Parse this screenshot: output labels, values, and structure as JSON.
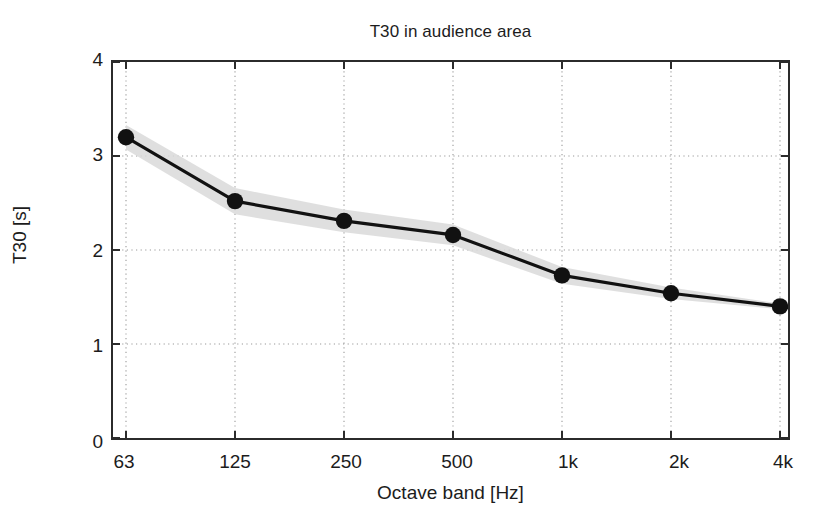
{
  "chart_data": {
    "type": "line",
    "title": "T30 in audience area",
    "xlabel": "Octave band [Hz]",
    "ylabel": "T30 [s]",
    "categories": [
      "63",
      "125",
      "250",
      "500",
      "1k",
      "2k",
      "4k"
    ],
    "values": [
      3.2,
      2.52,
      2.31,
      2.16,
      1.73,
      1.54,
      1.4
    ],
    "band_upper": [
      3.33,
      2.66,
      2.43,
      2.27,
      1.82,
      1.6,
      1.43
    ],
    "band_lower": [
      3.07,
      2.38,
      2.19,
      2.05,
      1.64,
      1.48,
      1.37
    ],
    "band_label": "standard deviation band",
    "series_name": "T30",
    "ylim": [
      0,
      4
    ],
    "yticks": [
      "0",
      "1",
      "2",
      "3",
      "4"
    ],
    "ytick_values": [
      0,
      1,
      2,
      3,
      4
    ],
    "xticks": [
      "63",
      "125",
      "250",
      "500",
      "1k",
      "2k",
      "4k"
    ],
    "grid": "dotted",
    "legend": "none",
    "marker": "filled-circle",
    "line_color": "#111111",
    "band_color": "#d9d9d9",
    "grid_color": "#9a9a9a",
    "axis_color": "#2b2b2b",
    "background_color": "#ffffff"
  }
}
